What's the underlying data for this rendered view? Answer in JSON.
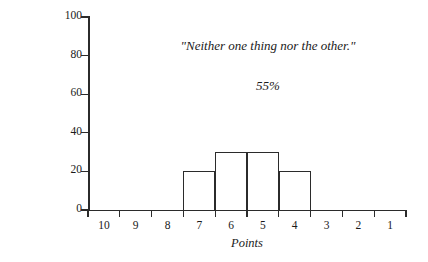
{
  "chart_data": {
    "type": "bar",
    "title": "",
    "xlabel": "Points",
    "ylabel": "No of Voters",
    "categories": [
      "10",
      "9",
      "8",
      "7",
      "6",
      "5",
      "4",
      "3",
      "2",
      "1"
    ],
    "values": [
      0,
      0,
      0,
      20,
      30,
      30,
      20,
      0,
      0,
      0
    ],
    "ylim": [
      0,
      100
    ],
    "yticks": [
      0,
      20,
      40,
      60,
      80,
      100
    ],
    "ytick_labels": [
      "0",
      "20",
      "40",
      "60",
      "80",
      "100"
    ],
    "grid": false,
    "legend": false,
    "x_axis_reversed": true,
    "annotations": [
      {
        "text": "\"Neither one thing nor the other.\"",
        "name": "quote"
      },
      {
        "text": "55%",
        "name": "percent"
      }
    ]
  }
}
